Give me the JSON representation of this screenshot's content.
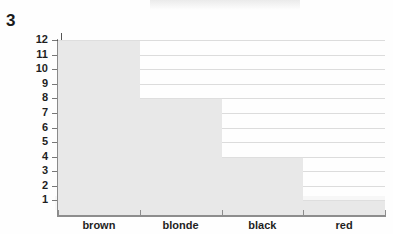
{
  "question_number": "3",
  "chart_data": {
    "type": "bar",
    "title": "",
    "subtitle": "",
    "xlabel": "",
    "ylabel": "",
    "categories": [
      "brown",
      "blonde",
      "black",
      "red"
    ],
    "values": [
      12,
      8,
      4,
      1
    ],
    "series": [
      {
        "name": "frequency",
        "values": [
          12,
          8,
          4,
          1
        ]
      }
    ],
    "ylim": [
      0,
      12
    ],
    "ytick_labels": [
      "12",
      "11",
      "10",
      "9",
      "8",
      "7",
      "6",
      "5",
      "4",
      "3",
      "2",
      "1"
    ],
    "ytick_values": [
      12,
      11,
      10,
      9,
      8,
      7,
      6,
      5,
      4,
      3,
      2,
      1
    ],
    "xtick_labels": [
      "brown",
      "blonde",
      "black",
      "red"
    ],
    "grid": true,
    "grid_axis": "y",
    "legend": false,
    "legend_position": "none",
    "bar_style": "contiguous-histogram",
    "annotations": []
  },
  "style": {
    "bar_fill": "#e8e8e8",
    "bar_border": "#dedede",
    "gridline_color": "#dcdcdc",
    "axis_color": "#8a8a8a",
    "text_color": "#1f1f1f",
    "background": "#fefefe"
  },
  "axis_top_mark": "J"
}
